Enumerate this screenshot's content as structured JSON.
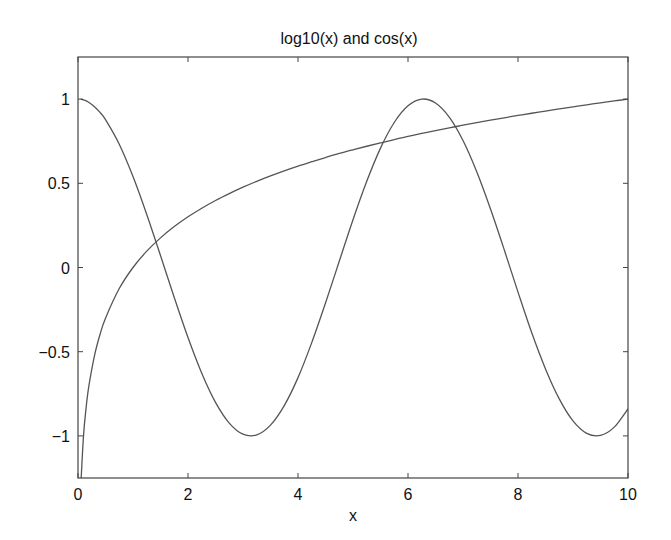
{
  "chart_data": {
    "type": "line",
    "title": "log10(x) and cos(x)",
    "xlabel": "x",
    "ylabel": "",
    "xlim": [
      0,
      10
    ],
    "ylim": [
      -1.25,
      1.25
    ],
    "grid": false,
    "legend": null,
    "xticks": [
      0,
      2,
      4,
      6,
      8,
      10
    ],
    "xtick_labels": [
      "0",
      "2",
      "4",
      "6",
      "8",
      "10"
    ],
    "yticks": [
      -1,
      -0.5,
      0,
      0.5,
      1
    ],
    "ytick_labels": [
      "−1",
      "−0.5",
      "0",
      "0.5",
      "1"
    ],
    "x": [
      0.05,
      0.1,
      0.15,
      0.2,
      0.3,
      0.4,
      0.5,
      0.75,
      1,
      1.25,
      1.5,
      1.75,
      2,
      2.25,
      2.5,
      2.75,
      3,
      3.25,
      3.5,
      3.75,
      4,
      4.25,
      4.5,
      4.75,
      5,
      5.25,
      5.5,
      5.75,
      6,
      6.25,
      6.5,
      6.75,
      7,
      7.25,
      7.5,
      7.75,
      8,
      8.25,
      8.5,
      8.75,
      9,
      9.25,
      9.5,
      9.75,
      10
    ],
    "series": [
      {
        "name": "log10(x)",
        "color": "#555555",
        "values": [
          -1.301,
          -1.0,
          -0.824,
          -0.699,
          -0.523,
          -0.398,
          -0.301,
          -0.125,
          0.0,
          0.097,
          0.176,
          0.243,
          0.301,
          0.352,
          0.398,
          0.439,
          0.477,
          0.512,
          0.544,
          0.574,
          0.602,
          0.628,
          0.653,
          0.677,
          0.699,
          0.72,
          0.74,
          0.76,
          0.778,
          0.796,
          0.813,
          0.829,
          0.845,
          0.86,
          0.875,
          0.889,
          0.903,
          0.916,
          0.929,
          0.942,
          0.954,
          0.966,
          0.978,
          0.989,
          1.0
        ]
      },
      {
        "name": "cos(x)",
        "color": "#555555",
        "values": [
          0.999,
          0.995,
          0.989,
          0.98,
          0.955,
          0.921,
          0.878,
          0.732,
          0.54,
          0.315,
          0.071,
          -0.178,
          -0.416,
          -0.628,
          -0.801,
          -0.924,
          -0.99,
          -0.994,
          -0.936,
          -0.82,
          -0.654,
          -0.446,
          -0.211,
          0.037,
          0.284,
          0.512,
          0.709,
          0.861,
          0.96,
          1.0,
          0.977,
          0.893,
          0.754,
          0.568,
          0.347,
          0.105,
          -0.146,
          -0.388,
          -0.602,
          -0.78,
          -0.911,
          -0.985,
          -0.997,
          -0.948,
          -0.839
        ]
      }
    ]
  }
}
